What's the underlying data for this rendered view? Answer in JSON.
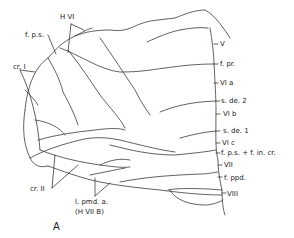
{
  "figure": {
    "panel_label": "A",
    "line_color": "#3a3a3a",
    "background": "#ffffff"
  },
  "labels": {
    "h_vi": "H VI",
    "f_ps_top": "f. p.s.",
    "cr_i": "cr. I",
    "cr_ii": "cr. II",
    "l_pmd_a": "l. pmd. a.",
    "h_vii_b": "(H VII B)",
    "v": "V",
    "f_pr": "f. pr.",
    "vi_a": "VI a",
    "s_de_2": "s. de. 2",
    "vi_b": "VI b",
    "s_de_1": "s. de. 1",
    "vi_c": "VI c",
    "f_ps_f_in_cr": "f. p.s. + f. in. cr.",
    "vii": "VII",
    "f_ppd": "f. ppd.",
    "viii": "VIII"
  }
}
